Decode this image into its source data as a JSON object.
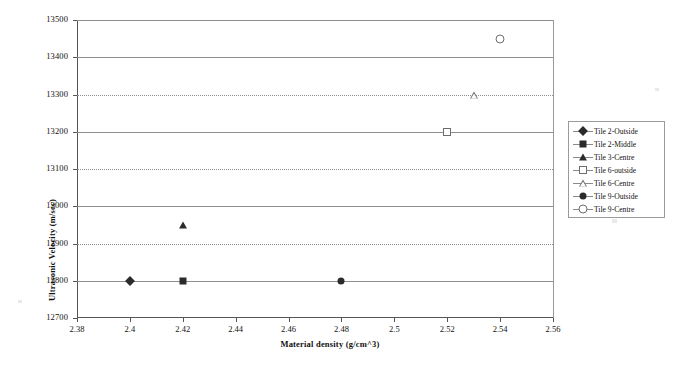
{
  "chart_data": {
    "type": "scatter",
    "title": "",
    "xlabel": "Material density (g/cm^3)",
    "ylabel": "Ultrasonic Velocity (m/sec)",
    "xlim": [
      2.38,
      2.56
    ],
    "ylim": [
      12700,
      13500
    ],
    "xticks": [
      "2.38",
      "2.4",
      "2.42",
      "2.44",
      "2.46",
      "2.48",
      "2.5",
      "2.52",
      "2.54",
      "2.56"
    ],
    "xtick_values": [
      2.38,
      2.4,
      2.42,
      2.44,
      2.46,
      2.48,
      2.5,
      2.52,
      2.54,
      2.56
    ],
    "yticks": [
      "12700",
      "12800",
      "12900",
      "13000",
      "13100",
      "13200",
      "13300",
      "13400",
      "13500"
    ],
    "ytick_values": [
      12700,
      12800,
      12900,
      13000,
      13100,
      13200,
      13300,
      13400,
      13500
    ],
    "grid": "horizontal",
    "legend_position": "right",
    "series": [
      {
        "name": "Tile 2-Outside",
        "marker": "diamond-filled",
        "color": "#2b2b2b",
        "x": [
          2.4
        ],
        "y": [
          12800
        ]
      },
      {
        "name": "Tile 2-Middle",
        "marker": "square-filled",
        "color": "#2b2b2b",
        "x": [
          2.42
        ],
        "y": [
          12800
        ]
      },
      {
        "name": "Tile 3-Centre",
        "marker": "triangle-filled",
        "color": "#2b2b2b",
        "x": [
          2.42
        ],
        "y": [
          12950
        ]
      },
      {
        "name": "Tile 6-outside",
        "marker": "square-open",
        "color": "#6d6d6d",
        "x": [
          2.52
        ],
        "y": [
          13200
        ]
      },
      {
        "name": "Tile 6-Centre",
        "marker": "triangle-open",
        "color": "#6d6d6d",
        "x": [
          2.53
        ],
        "y": [
          13300
        ]
      },
      {
        "name": "Tile 9-Outside",
        "marker": "circle-filled",
        "color": "#2b2b2b",
        "x": [
          2.48
        ],
        "y": [
          12800
        ]
      },
      {
        "name": "Tile 9-Centre",
        "marker": "circle-open",
        "color": "#6d6d6d",
        "x": [
          2.54
        ],
        "y": [
          13450
        ]
      }
    ]
  },
  "colors": {
    "axis": "#555555",
    "grid": "#8f8f8f",
    "filled_marker": "#2b2b2b",
    "open_marker": "#6d6d6d",
    "legend_border": "#9b9b9b",
    "background": "#ffffff"
  }
}
